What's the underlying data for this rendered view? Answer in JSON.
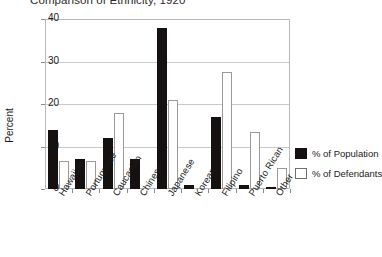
{
  "chart_data": {
    "type": "bar",
    "title": "Comparison of Ethnicity, 1920",
    "xlabel": "",
    "ylabel": "Percent",
    "ylim": [
      0,
      40
    ],
    "yticks": [
      0,
      10,
      20,
      30,
      40
    ],
    "grid": true,
    "legend_position": "right",
    "categories": [
      "Hawaiian",
      "Portuguese",
      "Caucasian",
      "Chinese",
      "Japanese",
      "Korean",
      "Filipino",
      "Puerto Rican",
      "Other"
    ],
    "series": [
      {
        "name": "% of Population",
        "color": "#141110",
        "values": [
          14,
          7,
          12,
          7,
          38,
          1,
          17,
          1,
          0.5
        ]
      },
      {
        "name": "% of Defendants",
        "color": "#ffffff",
        "values": [
          6.5,
          6.5,
          18,
          0,
          21,
          0,
          27.5,
          13.5,
          5
        ]
      }
    ]
  },
  "legend": {
    "items": [
      {
        "label": "% of Population"
      },
      {
        "label": "% of Defendants"
      }
    ]
  }
}
